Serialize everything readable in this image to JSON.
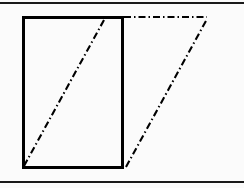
{
  "figure": {
    "canvas": {
      "width": 244,
      "height": 188,
      "background_color": "#fbfbfb"
    },
    "colors": {
      "stroke": "#000000",
      "rule": "#1a1a1a",
      "background": "#fbfbfb"
    },
    "rules": [
      {
        "name": "top-rule",
        "x1": 0,
        "y1": 3,
        "x2": 244,
        "y2": 3,
        "width": 1.6
      },
      {
        "name": "bottom-rule",
        "x1": 0,
        "y1": 182,
        "x2": 244,
        "y2": 182,
        "width": 1.6
      }
    ],
    "rectangle": {
      "name": "solid-rectangle",
      "x": 23,
      "y": 17,
      "width": 99,
      "height": 150,
      "stroke_width": 3,
      "fill": "none",
      "style": "solid"
    },
    "dashed_lines": [
      {
        "name": "diagonal-left",
        "x1": 24,
        "y1": 166,
        "x2": 104,
        "y2": 20,
        "style": "dash-dot",
        "width": 2.1
      },
      {
        "name": "horizontal-top",
        "x1": 124,
        "y1": 17,
        "x2": 207,
        "y2": 17,
        "style": "dash-dot",
        "width": 2.1
      },
      {
        "name": "diagonal-right",
        "x1": 126,
        "y1": 167,
        "x2": 207,
        "y2": 19,
        "style": "dash-dot",
        "width": 2.1
      }
    ],
    "dash_pattern": "7 3 1.5 3"
  }
}
